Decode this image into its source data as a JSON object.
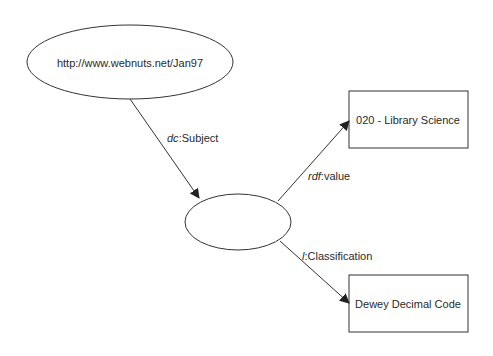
{
  "diagram": {
    "type": "rdf-graph",
    "nodes": [
      {
        "id": "subject",
        "shape": "ellipse",
        "label": "http://www.webnuts.net/Jan97"
      },
      {
        "id": "blank",
        "shape": "ellipse",
        "label": ""
      },
      {
        "id": "value",
        "shape": "rectangle",
        "label": "020 - Library Science"
      },
      {
        "id": "class",
        "shape": "rectangle",
        "label": "Dewey Decimal Code"
      }
    ],
    "edges": [
      {
        "from": "subject",
        "to": "blank",
        "prefix": "dc",
        "name": "Subject"
      },
      {
        "from": "blank",
        "to": "value",
        "prefix": "rdf",
        "name": "value"
      },
      {
        "from": "blank",
        "to": "class",
        "prefix": "l",
        "name": "Classification"
      }
    ]
  },
  "colors": {
    "stroke": "#333333",
    "background": "#ffffff"
  }
}
